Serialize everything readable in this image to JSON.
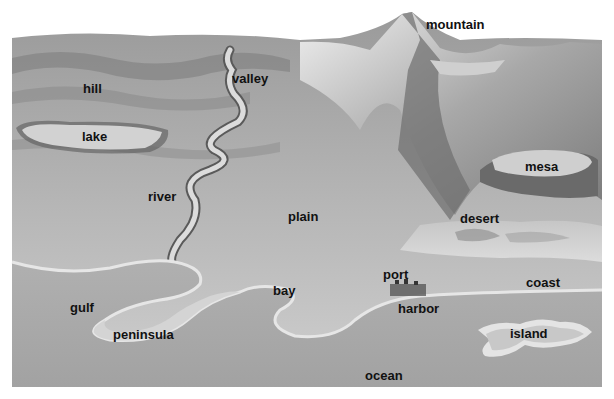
{
  "diagram": {
    "type": "landforms-and-water-bodies",
    "style": "grayscale illustration",
    "colors": {
      "background": "#ffffff",
      "land": "#b8b8b8",
      "land_dark": "#8a8a8a",
      "mountain_light": "#e6e6e6",
      "mountain_dark": "#6e6e6e",
      "water": "#a9a9a9",
      "shore": "#e2e2e2",
      "label_text": "#111111"
    },
    "labels": [
      {
        "id": "mountain",
        "text": "mountain",
        "x": 426,
        "y": 18
      },
      {
        "id": "valley",
        "text": "valley",
        "x": 232,
        "y": 72
      },
      {
        "id": "hill",
        "text": "hill",
        "x": 83,
        "y": 82
      },
      {
        "id": "lake",
        "text": "lake",
        "x": 82,
        "y": 130
      },
      {
        "id": "mesa",
        "text": "mesa",
        "x": 525,
        "y": 160
      },
      {
        "id": "river",
        "text": "river",
        "x": 148,
        "y": 190
      },
      {
        "id": "plain",
        "text": "plain",
        "x": 288,
        "y": 210
      },
      {
        "id": "desert",
        "text": "desert",
        "x": 460,
        "y": 212
      },
      {
        "id": "port",
        "text": "port",
        "x": 383,
        "y": 268
      },
      {
        "id": "bay",
        "text": "bay",
        "x": 273,
        "y": 284
      },
      {
        "id": "coast",
        "text": "coast",
        "x": 526,
        "y": 276
      },
      {
        "id": "gulf",
        "text": "gulf",
        "x": 70,
        "y": 301
      },
      {
        "id": "harbor",
        "text": "harbor",
        "x": 398,
        "y": 302
      },
      {
        "id": "peninsula",
        "text": "peninsula",
        "x": 113,
        "y": 328
      },
      {
        "id": "island",
        "text": "island",
        "x": 510,
        "y": 327
      },
      {
        "id": "ocean",
        "text": "ocean",
        "x": 365,
        "y": 369
      }
    ]
  }
}
